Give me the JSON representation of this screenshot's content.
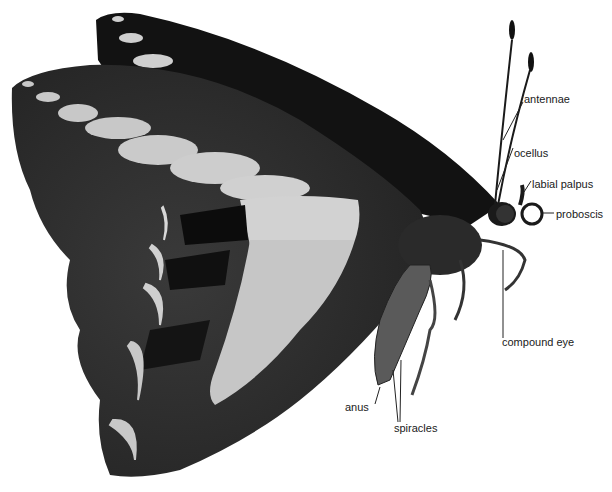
{
  "diagram": {
    "colors": {
      "background": "#ffffff",
      "forewing": "#141414",
      "hindwing": "#2b2b2b",
      "spots": "#c8c8c8",
      "body": "#4a4a4a",
      "label_text": "#1a1a1a",
      "leader_line": "#222222"
    },
    "labels": [
      {
        "id": "antennae",
        "text": "antennae",
        "x": 524,
        "y": 98
      },
      {
        "id": "ocellus",
        "text": "ocellus",
        "x": 514,
        "y": 143
      },
      {
        "id": "labial-palpus",
        "text": "labial palpus",
        "x": 532,
        "y": 177
      },
      {
        "id": "proboscis",
        "text": "proboscis",
        "x": 555,
        "y": 208
      },
      {
        "id": "compound-eye",
        "text": "compound eye",
        "x": 502,
        "y": 336
      },
      {
        "id": "anus",
        "text": "anus",
        "x": 345,
        "y": 403
      },
      {
        "id": "spiracles",
        "text": "spiracles",
        "x": 394,
        "y": 423
      }
    ]
  }
}
